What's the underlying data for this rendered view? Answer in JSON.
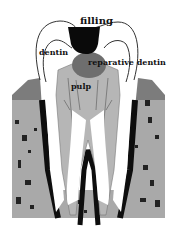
{
  "diagram": {
    "type": "tooth cross-section",
    "labels": {
      "filling": "filling",
      "dentin": "dentin",
      "reparative_dentin": "reparative dentin",
      "pulp": "pulp"
    },
    "colors": {
      "filling": "#0a0a0a",
      "reparative_dentin": "#6e6e6e",
      "pulp": "#b4b4b4",
      "bone": "#a8a8a8",
      "gum": "#8c8c8c",
      "root_outline": "#111111",
      "background": "#ffffff"
    }
  }
}
